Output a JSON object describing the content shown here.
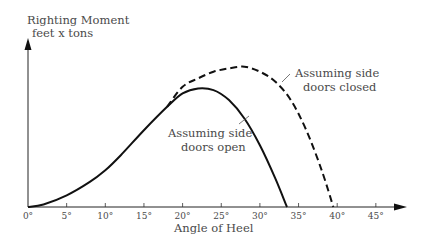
{
  "chart_data": {
    "type": "line",
    "title": "",
    "ylabel_line1": "Righting Moment",
    "ylabel_line2": "feet x tons",
    "xlabel": "Angle of Heel",
    "xlim": [
      0,
      47
    ],
    "ylim": [
      0,
      100
    ],
    "grid": false,
    "x_ticks": [
      0,
      5,
      10,
      15,
      20,
      25,
      30,
      35,
      40,
      45
    ],
    "x_tick_labels": [
      "0°",
      "5°",
      "10°",
      "15°",
      "20°",
      "25°",
      "30°",
      "35°",
      "40°",
      "45°"
    ],
    "series": [
      {
        "name": "Assuming side doors open",
        "style": "solid",
        "x": [
          0,
          2,
          5,
          8,
          10,
          12,
          15,
          18,
          20,
          22,
          24,
          26,
          28,
          30,
          32,
          33.5
        ],
        "y": [
          0,
          1.5,
          7,
          15,
          22,
          31,
          46,
          60,
          68,
          71,
          70,
          64,
          53,
          37,
          17,
          0
        ]
      },
      {
        "name": "Assuming side doors closed",
        "style": "dashed",
        "x": [
          18,
          20,
          22,
          24,
          26,
          28,
          30,
          32,
          34,
          36,
          38,
          39.5
        ],
        "y": [
          60,
          72,
          77,
          81,
          83,
          84,
          81,
          75,
          64,
          46,
          22,
          0
        ]
      }
    ],
    "annotations": [
      {
        "text_line1": "Assuming side",
        "text_line2": "doors open",
        "points_to": "solid curve"
      },
      {
        "text_line1": "Assuming side",
        "text_line2": "doors closed",
        "points_to": "dashed curve"
      }
    ]
  }
}
